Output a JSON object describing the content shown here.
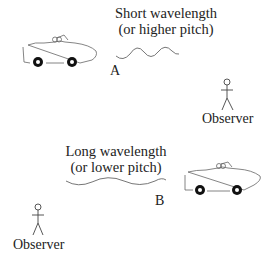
{
  "diagram": {
    "top": {
      "caption_line1": "Short wavelength",
      "caption_line2": "(or higher pitch)",
      "position_label": "A",
      "observer_label": "Observer"
    },
    "bottom": {
      "caption_line1": "Long wavelength",
      "caption_line2": "(or lower pitch)",
      "position_label": "B",
      "observer_label": "Observer"
    },
    "colors": {
      "line": "#555555",
      "wheel": "#111111",
      "text": "#222222"
    }
  }
}
